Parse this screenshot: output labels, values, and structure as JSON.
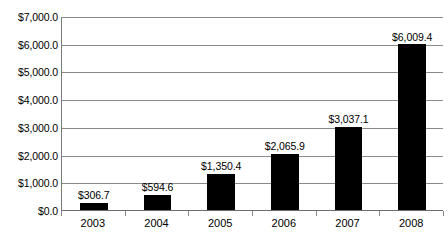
{
  "chart_data": {
    "type": "bar",
    "title": "",
    "subtitle": "",
    "xlabel": "",
    "ylabel": "",
    "categories": [
      "2003",
      "2004",
      "2005",
      "2006",
      "2007",
      "2008"
    ],
    "values": [
      306.7,
      594.6,
      1350.4,
      2065.9,
      3037.1,
      6009.4
    ],
    "value_labels": [
      "$306.7",
      "$594.6",
      "$1,350.4",
      "$2,065.9",
      "$3,037.1",
      "$6,009.4"
    ],
    "series": [
      {
        "name": "",
        "values": [
          306.7,
          594.6,
          1350.4,
          2065.9,
          3037.1,
          6009.4
        ]
      }
    ],
    "ylim": [
      0,
      7000
    ],
    "ytick_values": [
      0,
      1000,
      2000,
      3000,
      4000,
      5000,
      6000,
      7000
    ],
    "ytick_labels": [
      "$0.0",
      "$1,000.0",
      "$2,000.0",
      "$3,000.0",
      "$4,000.0",
      "$5,000.0",
      "$6,000.0",
      "$7,000.0"
    ],
    "grid": true,
    "legend": "none",
    "bar_color": "#000000",
    "grid_color": "#8a8a8a",
    "axis_color": "#6b6b6b"
  }
}
